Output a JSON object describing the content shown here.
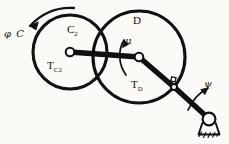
{
  "figure": {
    "background_color": "#fbfaf7",
    "ink_color": "#111111",
    "width": 229,
    "height": 144
  },
  "labels": {
    "input_rotation": {
      "symbol": "φ",
      "name": "C",
      "text": "φ C"
    },
    "disc_left": "C",
    "disc_left_subscript": "2",
    "torque_left": "T",
    "torque_left_subscript": "C2",
    "disc_right": "D",
    "angle_mu": "μ",
    "torque_right": "T",
    "torque_right_subscript": "D",
    "angle_psi": "ψ"
  },
  "geometry": {
    "left_disc": {
      "cx": 70,
      "cy": 52,
      "r": 37
    },
    "right_disc": {
      "cx": 139,
      "cy": 57,
      "r": 46
    },
    "left_pivot": {
      "cx": 70,
      "cy": 52,
      "r": 4
    },
    "right_pivot": {
      "cx": 139,
      "cy": 57,
      "r": 4
    },
    "pin_joint": {
      "cx": 174,
      "cy": 87
    },
    "ground_pivot": {
      "cx": 209,
      "cy": 120,
      "r": 6
    },
    "coupler_link": {
      "from": [
        70,
        52
      ],
      "to": [
        139,
        57
      ]
    },
    "crank_link": {
      "from": [
        139,
        57
      ],
      "to": [
        174,
        87
      ]
    },
    "output_link": {
      "from": [
        174,
        87
      ],
      "to": [
        209,
        120
      ]
    }
  },
  "arrows": {
    "input_arc": {
      "direction": "counterclockwise",
      "label": "φ C"
    },
    "mu_arc": {
      "direction": "counterclockwise",
      "label": "μ"
    },
    "psi_arc": {
      "direction": "counterclockwise",
      "label": "ψ"
    }
  }
}
